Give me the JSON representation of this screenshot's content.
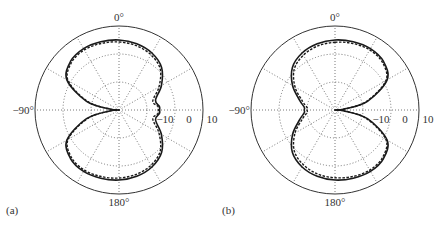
{
  "figure": {
    "panels": [
      {
        "id": "a",
        "label": "(a)",
        "angle_labels": {
          "top": "0°",
          "bottom": "180°",
          "left": "−90°"
        },
        "radial_tick_labels": [
          "−10",
          "0",
          "10"
        ]
      },
      {
        "id": "b",
        "label": "(b)",
        "angle_labels": {
          "top": "0°",
          "bottom": "180°",
          "left": "−90°"
        },
        "radial_tick_labels": [
          "−10",
          "0",
          "10"
        ]
      }
    ]
  },
  "colors": {
    "curve": "#1a1a1a",
    "grid": "#555555",
    "frame": "#333333"
  },
  "chart_data": [
    {
      "type": "polar-line",
      "title": "(a)",
      "angle_unit": "degrees",
      "angle_zero": "top",
      "angle_direction": "clockwise",
      "angle_ticks": [
        0,
        30,
        60,
        90,
        120,
        150,
        180,
        -150,
        -120,
        -90,
        -60,
        -30
      ],
      "angle_tick_labels_shown": {
        "0": "0°",
        "180": "180°",
        "-90": "−90°"
      },
      "radial_unit": "dB",
      "radial_ticks": [
        -10,
        0,
        10
      ],
      "radial_range": [
        -20,
        10
      ],
      "grid": true,
      "series": [
        {
          "name": "solid",
          "style": "solid",
          "theta": [
            0,
            15,
            30,
            45,
            60,
            75,
            85,
            90,
            95,
            105,
            120,
            135,
            150,
            165,
            180,
            -165,
            -150,
            -135,
            -120,
            -105,
            -95,
            -90,
            -85,
            -75,
            -60,
            -45,
            -30,
            -15
          ],
          "r_db": [
            5,
            4.5,
            3.5,
            1.5,
            -2.5,
            -6.5,
            -5.5,
            -5.5,
            -5.5,
            -6.5,
            -2.5,
            1.5,
            3.5,
            4.5,
            5,
            5.2,
            5.3,
            4.5,
            1.5,
            -8,
            -17,
            -20,
            -17,
            -8,
            1.5,
            4.5,
            5.3,
            5.2
          ]
        },
        {
          "name": "dashed",
          "style": "dashed",
          "theta": [
            0,
            15,
            30,
            45,
            60,
            75,
            85,
            90,
            95,
            105,
            120,
            135,
            150,
            165,
            180,
            -165,
            -150,
            -135,
            -120,
            -105,
            -95,
            -90,
            -85,
            -75,
            -60,
            -45,
            -30,
            -15
          ],
          "r_db": [
            4.3,
            3.8,
            2.8,
            0.8,
            -3.5,
            -7.5,
            -6,
            -6,
            -6,
            -7.5,
            -3.5,
            0.8,
            2.8,
            3.8,
            4.3,
            4.6,
            4.8,
            4,
            1,
            -8.5,
            -17,
            -20,
            -17,
            -8.5,
            1,
            4,
            4.8,
            4.6
          ]
        }
      ]
    },
    {
      "type": "polar-line",
      "title": "(b)",
      "angle_unit": "degrees",
      "angle_zero": "top",
      "angle_direction": "clockwise",
      "angle_ticks": [
        0,
        30,
        60,
        90,
        120,
        150,
        180,
        -150,
        -120,
        -90,
        -60,
        -30
      ],
      "angle_tick_labels_shown": {
        "0": "0°",
        "180": "180°",
        "-90": "−90°"
      },
      "radial_unit": "dB",
      "radial_ticks": [
        -10,
        0,
        10
      ],
      "radial_range": [
        -20,
        10
      ],
      "grid": true,
      "series": [
        {
          "name": "solid",
          "style": "solid",
          "theta": [
            0,
            15,
            30,
            45,
            60,
            75,
            85,
            90,
            95,
            105,
            120,
            135,
            150,
            165,
            180,
            -165,
            -150,
            -135,
            -120,
            -105,
            -95,
            -90,
            -85,
            -75,
            -60,
            -45,
            -30,
            -15
          ],
          "r_db": [
            5,
            5.2,
            5.3,
            4.5,
            1.5,
            -8,
            -17,
            -20,
            -17,
            -8,
            1.5,
            4.5,
            5.3,
            5.2,
            5,
            4.5,
            3.5,
            1.5,
            -2.5,
            -7,
            -9,
            -9,
            -9,
            -7,
            -2.5,
            1.5,
            3.5,
            4.5
          ]
        },
        {
          "name": "dashed",
          "style": "dashed",
          "theta": [
            0,
            15,
            30,
            45,
            60,
            75,
            85,
            90,
            95,
            105,
            120,
            135,
            150,
            165,
            180,
            -165,
            -150,
            -135,
            -120,
            -105,
            -95,
            -90,
            -85,
            -75,
            -60,
            -45,
            -30,
            -15
          ],
          "r_db": [
            4.2,
            4.6,
            4.8,
            4,
            1,
            -8.5,
            -17,
            -20,
            -17,
            -8.5,
            1,
            4,
            4.8,
            4.6,
            4.2,
            3.7,
            2.6,
            0.6,
            -3.5,
            -8,
            -10,
            -10,
            -10,
            -8,
            -3.5,
            0.6,
            2.6,
            3.7
          ]
        }
      ]
    }
  ]
}
